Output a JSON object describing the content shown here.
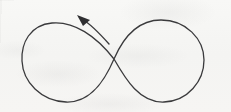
{
  "figure": {
    "background_color": "#f6f6f4",
    "ink_color": "#3a3a3c",
    "arrow_fill_color": "#2f2f31",
    "width": 231,
    "height": 112,
    "caption": "",
    "annotations": [],
    "labels": []
  },
  "shapes": {
    "lemniscate": {
      "name": "figure-eight-curve",
      "stroke_width": 1.3,
      "crossing_point": {
        "x": 114,
        "y": 59
      },
      "left_lobe": {
        "extent_x": [
          22,
          114
        ],
        "extent_y": [
          21,
          102
        ],
        "center": {
          "x": 67,
          "y": 61
        }
      },
      "right_lobe": {
        "extent_x": [
          114,
          204
        ],
        "extent_y": [
          20,
          102
        ],
        "center": {
          "x": 159,
          "y": 60
        }
      },
      "path": "M 114 59 C 96 36, 74 21, 52 23 C 30 25, 21 43, 22 61 C 23 82, 41 101, 66 102 C 91 103, 105 80, 114 59 C 123 38, 137 20, 161 20 C 186 20, 204 39, 204 60 C 204 81, 188 101, 164 102 C 140 103, 126 80, 114 59 Z"
    },
    "direction_arrow": {
      "name": "counterclockwise-direction-arrow",
      "stroke_width": 1.4,
      "tail": {
        "x": 109,
        "y": 44
      },
      "tip": {
        "x": 77,
        "y": 16
      },
      "direction": "up-left",
      "path": "M 109 44 C 101 35, 92 25, 82 19",
      "head_points": "77,15 90,20 83,26"
    }
  }
}
